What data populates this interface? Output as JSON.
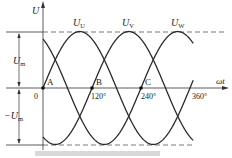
{
  "chart_data": {
    "type": "line",
    "title": "",
    "xlabel": "ωt",
    "ylabel": "U",
    "x_ticks": [
      "0",
      "120°",
      "240°",
      "360°"
    ],
    "x_tick_values_deg": [
      0,
      120,
      240,
      360
    ],
    "y_annotations": [
      "U_m",
      "-U_m"
    ],
    "ylim": [
      -1,
      1
    ],
    "xlim_deg": [
      0,
      360
    ],
    "series": [
      {
        "name": "U_U",
        "label_main": "U",
        "label_sub": "U",
        "phase_deg": 0,
        "peak_deg": 90
      },
      {
        "name": "U_V",
        "label_main": "U",
        "label_sub": "V",
        "phase_deg": -120,
        "peak_deg": 210
      },
      {
        "name": "U_W",
        "label_main": "U",
        "label_sub": "W",
        "phase_deg": -240,
        "peak_deg": 330
      }
    ],
    "points": [
      {
        "label": "A",
        "x_deg": 0,
        "y": 0
      },
      {
        "label": "B",
        "x_deg": 120,
        "y": 0
      },
      {
        "label": "C",
        "x_deg": 240,
        "y": 0
      }
    ],
    "reference_lines": [
      {
        "name": "U_m",
        "y": 1,
        "style": "dashed"
      },
      {
        "name": "-U_m",
        "y": -1,
        "style": "dashed"
      }
    ]
  },
  "labels": {
    "y_axis": "U",
    "x_axis": "ωt",
    "origin": "0",
    "tick_120": "120°",
    "tick_240": "240°",
    "tick_360": "360°",
    "um_main": "U",
    "um_sub": "m",
    "neg_um_main": "−U",
    "neg_um_sub": "m",
    "point_a": "A",
    "point_b": "B",
    "point_c": "C",
    "uu_main": "U",
    "uu_sub": "U",
    "uv_main": "U",
    "uv_sub": "V",
    "uw_main": "U",
    "uw_sub": "W"
  },
  "colors": {
    "curve": "#2a2a2a",
    "axis": "#333333",
    "dashed": "#555555",
    "bar": "#d9d9d9"
  }
}
